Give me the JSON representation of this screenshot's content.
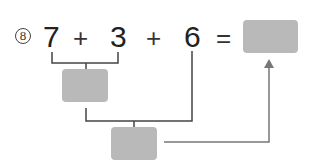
{
  "problem": {
    "label": "8",
    "terms": [
      "7",
      "3",
      "6"
    ],
    "operators": [
      "+",
      "+",
      "="
    ],
    "answer_box": "",
    "step1_box": "",
    "step2_box": ""
  },
  "colors": {
    "box": "#b9b9b9",
    "line": "#444444",
    "arrow": "#777777"
  }
}
